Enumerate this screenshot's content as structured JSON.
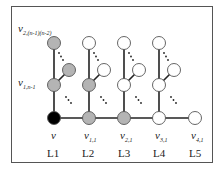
{
  "diagram": {
    "colors": {
      "root": "#000000",
      "visited": "#b4b4b4",
      "unvisited": "#ffffff"
    },
    "labels": {
      "top_left": {
        "main": "v",
        "sub": "2,(n-1)(n-2)"
      },
      "mid_left": {
        "main": "v",
        "sub": "1,n-1"
      },
      "bottom": [
        {
          "main": "v",
          "sub": ""
        },
        {
          "main": "v",
          "sub": "1,1"
        },
        {
          "main": "v",
          "sub": "2,1"
        },
        {
          "main": "v",
          "sub": "3,1"
        },
        {
          "main": "v",
          "sub": "4,1"
        }
      ]
    },
    "levels": [
      "L1",
      "L2",
      "L3",
      "L4",
      "L5"
    ],
    "columns": [
      {
        "level": "L1",
        "top": "visited",
        "side": "visited",
        "mid": "visited",
        "base": "root"
      },
      {
        "level": "L2",
        "top": "unvisited",
        "side": "unvisited",
        "mid": "visited",
        "base": "visited"
      },
      {
        "level": "L3",
        "top": "unvisited",
        "side": "unvisited",
        "mid": "unvisited",
        "base": "visited"
      },
      {
        "level": "L4",
        "top": "unvisited",
        "side": "unvisited",
        "mid": "unvisited",
        "base": "unvisited"
      },
      {
        "level": "L5",
        "base": "unvisited"
      }
    ],
    "ellipsis": "...",
    "caption": ""
  }
}
